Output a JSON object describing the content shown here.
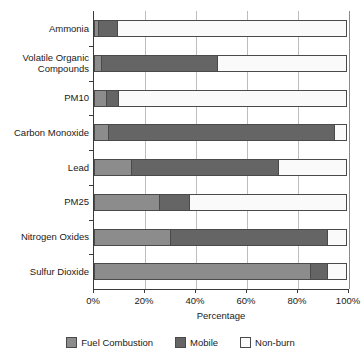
{
  "chart_data": {
    "type": "bar",
    "orientation": "horizontal",
    "stacked": true,
    "stack_mode": "percent",
    "title": "",
    "xlabel": "Percentage",
    "ylabel": "",
    "xlim": [
      0,
      100
    ],
    "xticks": [
      0,
      20,
      40,
      60,
      80,
      100
    ],
    "xticklabels": [
      "0%",
      "20%",
      "40%",
      "60%",
      "80%",
      "100%"
    ],
    "grid": true,
    "grid_axis": "x",
    "legend_position": "bottom",
    "categories": [
      "Ammonia",
      "Volatile Organic Compounds",
      "PM10",
      "Carbon Monoxide",
      "Lead",
      "PM25",
      "Nitrogen Oxides",
      "Sulfur Dioxide"
    ],
    "category_lines": [
      [
        "Ammonia"
      ],
      [
        "Volatile Organic",
        "Compounds"
      ],
      [
        "PM10"
      ],
      [
        "Carbon Monoxide"
      ],
      [
        "Lead"
      ],
      [
        "PM25"
      ],
      [
        "Nitrogen Oxides"
      ],
      [
        "Sulfur Dioxide"
      ]
    ],
    "series": [
      {
        "name": "Fuel Combustion",
        "color": "#8c8c8c",
        "values": [
          2,
          3,
          5,
          6,
          15,
          26,
          30,
          85
        ]
      },
      {
        "name": "Mobile",
        "color": "#656565",
        "values": [
          8,
          46,
          5,
          89,
          58,
          12,
          62,
          7
        ]
      },
      {
        "name": "Non-burn",
        "color": "#fafafa",
        "values": [
          90,
          51,
          90,
          5,
          27,
          62,
          8,
          8
        ]
      }
    ],
    "cumulative_boundaries": [
      [
        2,
        10
      ],
      [
        3,
        49
      ],
      [
        5,
        10
      ],
      [
        6,
        95
      ],
      [
        15,
        73
      ],
      [
        26,
        38
      ],
      [
        30,
        92
      ],
      [
        85,
        92
      ]
    ]
  },
  "legend": {
    "items": [
      {
        "label": "Fuel Combustion",
        "color": "#8c8c8c"
      },
      {
        "label": "Mobile",
        "color": "#656565"
      },
      {
        "label": "Non-burn",
        "color": "#fafafa"
      }
    ]
  },
  "axis": {
    "x_title": "Percentage"
  }
}
